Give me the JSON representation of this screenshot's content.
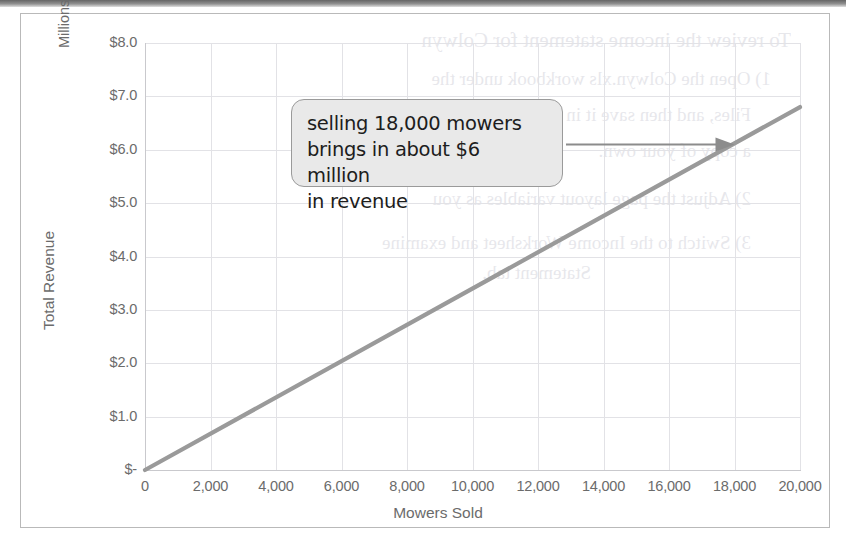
{
  "chart_data": {
    "type": "line",
    "title": "",
    "xlabel": "Mowers Sold",
    "ylabel": "Total Revenue",
    "y_unit_label": "Millions",
    "xlim": [
      0,
      20000
    ],
    "ylim": [
      0,
      8000000
    ],
    "grid": true,
    "legend": "none",
    "x_ticks": [
      "0",
      "2,000",
      "4,000",
      "6,000",
      "8,000",
      "10,000",
      "12,000",
      "14,000",
      "16,000",
      "18,000",
      "20,000"
    ],
    "x_tick_values": [
      0,
      2000,
      4000,
      6000,
      8000,
      10000,
      12000,
      14000,
      16000,
      18000,
      20000
    ],
    "y_ticks": [
      "$-",
      "$1.0",
      "$2.0",
      "$3.0",
      "$4.0",
      "$5.0",
      "$6.0",
      "$7.0",
      "$8.0"
    ],
    "y_tick_values": [
      0,
      1000000,
      2000000,
      3000000,
      4000000,
      5000000,
      6000000,
      7000000,
      8000000
    ],
    "series": [
      {
        "name": "Total Revenue",
        "color": "#9a9a9a",
        "x": [
          0,
          20000
        ],
        "values": [
          0,
          6800000
        ]
      }
    ],
    "annotations": [
      {
        "name": "revenue-callout",
        "lines": [
          "selling 18,000 mowers",
          "brings in about $6 million",
          "in revenue"
        ],
        "target_x": 18000,
        "target_y": 6100000,
        "arrow": "right-arrow"
      }
    ]
  },
  "callout": {
    "line1": "selling 18,000 mowers",
    "line2": "brings in about $6 million",
    "line3": "in revenue"
  },
  "axes": {
    "x_title": "Mowers Sold",
    "y_title": "Total Revenue",
    "y_unit": "Millions"
  },
  "ghost_text": {
    "l1": "To review the income statement for Colwyn",
    "l2": "1)  Open the Colwyn.xls workbook under the",
    "l3": "Files, and then save it in your primary folder",
    "l4": "a copy of your own.",
    "l5": "2)  Adjust the page layout variables as you",
    "l6": "3)  Switch to the Income Worksheet and examine",
    "l7": "Statement tab."
  }
}
